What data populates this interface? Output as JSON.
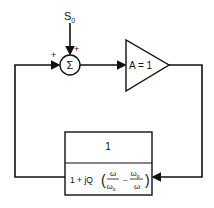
{
  "input_label": "S",
  "input_subscript": "0",
  "summer_symbol": "Σ",
  "summer_signs": {
    "feedback": "+",
    "input": "+"
  },
  "amplifier_label": "A = 1",
  "filter": {
    "numerator": "1",
    "denominator_prefix": "1 + jQ",
    "frac1_num": "ω",
    "frac1_den": "ω",
    "frac1_den_sub": "o",
    "minus": "–",
    "frac2_num": "ω",
    "frac2_num_sub": "o",
    "frac2_den": "ω"
  }
}
